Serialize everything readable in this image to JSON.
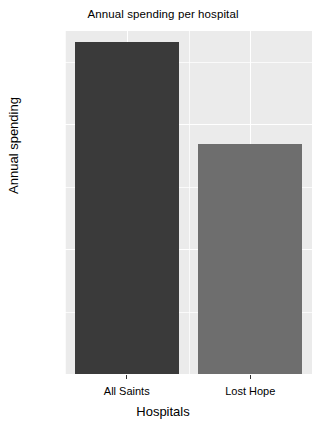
{
  "chart_data": {
    "type": "bar",
    "title": "Annual spending per hospital",
    "xlabel": "Hospitals",
    "ylabel": "Annual spending",
    "categories": [
      "All Saints",
      "Lost Hope"
    ],
    "values": [
      1328,
      922
    ],
    "ylim": [
      0,
      1372
    ],
    "ytick_labels": [
      "0",
      "500",
      "1000"
    ],
    "ytick_values": [
      0,
      500,
      1000
    ],
    "yminor_values": [
      250,
      750,
      1250
    ],
    "grid": true,
    "legend": "none",
    "bar_colors": [
      "#3a3a3a",
      "#6e6e6e"
    ],
    "panel_background": "#ebebeb",
    "grid_color": "#ffffff",
    "plot_background": "#ffffff"
  }
}
